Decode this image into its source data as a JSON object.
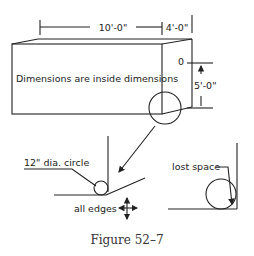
{
  "diagram": {
    "dimensions": {
      "length": "10'-0\"",
      "depth": "4'-0\"",
      "height": "5'-0\"",
      "zero_mark": "0"
    },
    "box_note": "Dimensions are inside dimensions",
    "detail_left": {
      "circle_label": "12\" dia. circle",
      "edges_label": "all edges"
    },
    "detail_right": {
      "label": "lost space"
    },
    "caption": "Figure 52–7"
  }
}
